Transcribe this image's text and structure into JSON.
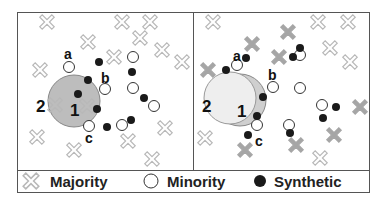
{
  "colors": {
    "frame": "#555555",
    "majority_outline": "#b8b8b8",
    "majority_filled": "#a6a6a6",
    "minority_stroke": "#333333",
    "synthetic": "#1a1a1a",
    "circle2_left_fill": "#bcbcbc",
    "circle1_right_fill": "#d4d4d4",
    "circle2_right_fill": "#eeeeee"
  },
  "legend": {
    "majority": "Majority",
    "minority": "Minority",
    "synthetic": "Synthetic"
  },
  "left_panel": {
    "labels": {
      "a": "a",
      "b": "b",
      "c": "c",
      "one": "1",
      "two": "2"
    },
    "majority": [
      [
        47,
        22
      ],
      [
        122,
        22
      ],
      [
        150,
        22
      ],
      [
        88,
        42
      ],
      [
        140,
        38
      ],
      [
        162,
        50
      ],
      [
        182,
        62
      ],
      [
        114,
        57
      ],
      [
        40,
        70
      ],
      [
        55,
        105
      ],
      [
        87,
        106
      ],
      [
        37,
        137
      ],
      [
        74,
        150
      ],
      [
        128,
        141
      ],
      [
        165,
        128
      ],
      [
        152,
        159
      ]
    ],
    "minority": [
      [
        69,
        67
      ],
      [
        105,
        89
      ],
      [
        133,
        57
      ],
      [
        133,
        88
      ],
      [
        154,
        106
      ],
      [
        89,
        126
      ],
      [
        122,
        125
      ]
    ],
    "synthetic": [
      [
        99,
        62
      ],
      [
        88,
        80
      ],
      [
        78,
        94
      ],
      [
        97,
        109
      ],
      [
        107,
        127
      ],
      [
        132,
        72
      ],
      [
        144,
        98
      ],
      [
        131,
        120
      ]
    ]
  },
  "right_panel": {
    "labels": {
      "a": "a",
      "b": "b",
      "c": "c",
      "one": "1",
      "two": "2"
    },
    "majority_outline": [
      [
        213,
        22
      ],
      [
        318,
        22
      ],
      [
        348,
        22
      ],
      [
        330,
        48
      ],
      [
        350,
        62
      ],
      [
        205,
        138
      ],
      [
        320,
        158
      ]
    ],
    "majority_filled": [
      [
        288,
        32
      ],
      [
        252,
        44
      ],
      [
        208,
        70
      ],
      [
        279,
        57
      ],
      [
        360,
        107
      ],
      [
        334,
        135
      ],
      [
        245,
        150
      ],
      [
        296,
        145
      ]
    ],
    "minority": [
      [
        237,
        65
      ],
      [
        273,
        87
      ],
      [
        300,
        55
      ],
      [
        300,
        88
      ],
      [
        322,
        105
      ],
      [
        289,
        125
      ],
      [
        257,
        125
      ]
    ],
    "synthetic": [
      [
        246,
        58
      ],
      [
        226,
        70
      ],
      [
        263,
        97
      ],
      [
        300,
        48
      ],
      [
        293,
        57
      ],
      [
        336,
        107
      ],
      [
        323,
        118
      ],
      [
        257,
        116
      ],
      [
        248,
        135
      ],
      [
        290,
        133
      ]
    ]
  }
}
